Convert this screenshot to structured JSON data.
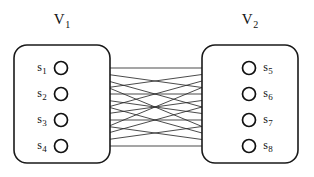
{
  "figure": {
    "type": "bipartite-graph",
    "background_color": "#ffffff",
    "line_color": "#2b2b2b",
    "node_stroke_color": "#111111",
    "box_stroke_color": "#1a1a1a"
  },
  "sets": {
    "left": {
      "title_base": "V",
      "title_sub": "1",
      "box": {
        "x": 14,
        "y": 45,
        "width": 96,
        "height": 118,
        "radius": 13
      },
      "title_pos": {
        "x": 62,
        "y": 24
      }
    },
    "right": {
      "title_base": "V",
      "title_sub": "2",
      "box": {
        "x": 202,
        "y": 45,
        "width": 96,
        "height": 118,
        "radius": 13
      },
      "title_pos": {
        "x": 250,
        "y": 24
      }
    }
  },
  "nodes": {
    "left": [
      {
        "id": "s1",
        "label_base": "s",
        "label_sub": "1",
        "cx": 61,
        "cy": 68,
        "r": 6.5,
        "label_x": 42,
        "label_y": 71
      },
      {
        "id": "s2",
        "label_base": "s",
        "label_sub": "2",
        "cx": 61,
        "cy": 94,
        "r": 6.5,
        "label_x": 42,
        "label_y": 97
      },
      {
        "id": "s3",
        "label_base": "s",
        "label_sub": "3",
        "cx": 61,
        "cy": 120,
        "r": 6.5,
        "label_x": 42,
        "label_y": 123
      },
      {
        "id": "s4",
        "label_base": "s",
        "label_sub": "4",
        "cx": 61,
        "cy": 146,
        "r": 6.5,
        "label_x": 42,
        "label_y": 149
      }
    ],
    "right": [
      {
        "id": "s5",
        "label_base": "s",
        "label_sub": "5",
        "cx": 249,
        "cy": 68,
        "r": 6.5,
        "label_x": 268,
        "label_y": 71
      },
      {
        "id": "s6",
        "label_base": "s",
        "label_sub": "6",
        "cx": 249,
        "cy": 94,
        "r": 6.5,
        "label_x": 268,
        "label_y": 97
      },
      {
        "id": "s7",
        "label_base": "s",
        "label_sub": "7",
        "cx": 249,
        "cy": 120,
        "r": 6.5,
        "label_x": 268,
        "label_y": 123
      },
      {
        "id": "s8",
        "label_base": "s",
        "label_sub": "8",
        "cx": 249,
        "cy": 146,
        "r": 6.5,
        "label_x": 268,
        "label_y": 149
      }
    ]
  },
  "edges": [
    {
      "from": "s1",
      "to": "s5"
    },
    {
      "from": "s1",
      "to": "s6"
    },
    {
      "from": "s1",
      "to": "s7"
    },
    {
      "from": "s1",
      "to": "s8"
    },
    {
      "from": "s2",
      "to": "s5"
    },
    {
      "from": "s2",
      "to": "s6"
    },
    {
      "from": "s2",
      "to": "s7"
    },
    {
      "from": "s2",
      "to": "s8"
    },
    {
      "from": "s3",
      "to": "s5"
    },
    {
      "from": "s3",
      "to": "s6"
    },
    {
      "from": "s3",
      "to": "s7"
    },
    {
      "from": "s3",
      "to": "s8"
    },
    {
      "from": "s4",
      "to": "s5"
    },
    {
      "from": "s4",
      "to": "s6"
    },
    {
      "from": "s4",
      "to": "s7"
    },
    {
      "from": "s4",
      "to": "s8"
    }
  ]
}
